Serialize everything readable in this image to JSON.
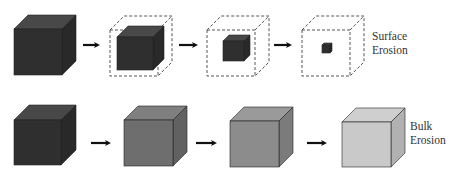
{
  "diagram": {
    "rows": [
      {
        "id": "surface",
        "label_lines": [
          "Surface",
          "Erosion"
        ],
        "stages": [
          {
            "outer": {
              "x": 14,
              "y": 29,
              "w": 48,
              "h": 46,
              "d": 14,
              "dashed": false,
              "color": "#2f2f2f"
            },
            "inner": null
          },
          {
            "outer": {
              "x": 110,
              "y": 30,
              "w": 48,
              "h": 46,
              "d": 14,
              "dashed": true
            },
            "inner": {
              "x": 117,
              "y": 37,
              "w": 36,
              "h": 33,
              "d": 11,
              "color": "#2f2f2f"
            }
          },
          {
            "outer": {
              "x": 207,
              "y": 30,
              "w": 48,
              "h": 46,
              "d": 14,
              "dashed": true
            },
            "inner": {
              "x": 223,
              "y": 41,
              "w": 21,
              "h": 20,
              "d": 6,
              "color": "#2f2f2f"
            }
          },
          {
            "outer": {
              "x": 302,
              "y": 30,
              "w": 48,
              "h": 46,
              "d": 14,
              "dashed": true
            },
            "inner": {
              "x": 322,
              "y": 45,
              "w": 8,
              "h": 8,
              "d": 2,
              "color": "#2f2f2f"
            }
          }
        ],
        "arrows": [
          {
            "x1": 83,
            "x2": 101,
            "y": 45
          },
          {
            "x1": 179,
            "x2": 199,
            "y": 45
          },
          {
            "x1": 274,
            "x2": 293,
            "y": 45
          }
        ],
        "label_pos": {
          "x": 372,
          "y": 40
        }
      },
      {
        "id": "bulk",
        "label_lines": [
          "Bulk",
          "Erosion"
        ],
        "stages": [
          {
            "outer": {
              "x": 14,
              "y": 120,
              "w": 47,
              "h": 45,
              "d": 15,
              "dashed": false,
              "color": "#2f2f2f"
            },
            "inner": null
          },
          {
            "outer": {
              "x": 124,
              "y": 120,
              "w": 49,
              "h": 46,
              "d": 14,
              "dashed": false,
              "color": "#6e6e6e"
            },
            "inner": null
          },
          {
            "outer": {
              "x": 230,
              "y": 121,
              "w": 49,
              "h": 46,
              "d": 14,
              "dashed": false,
              "color": "#8c8c8c"
            },
            "inner": null
          },
          {
            "outer": {
              "x": 342,
              "y": 122,
              "w": 49,
              "h": 45,
              "d": 14,
              "dashed": false,
              "color": "#c9c9c9"
            },
            "inner": null
          }
        ],
        "arrows": [
          {
            "x1": 91,
            "x2": 112,
            "y": 143
          },
          {
            "x1": 196,
            "x2": 218,
            "y": 143
          },
          {
            "x1": 307,
            "x2": 328,
            "y": 143
          }
        ],
        "label_pos": {
          "x": 410,
          "y": 130
        }
      }
    ]
  }
}
